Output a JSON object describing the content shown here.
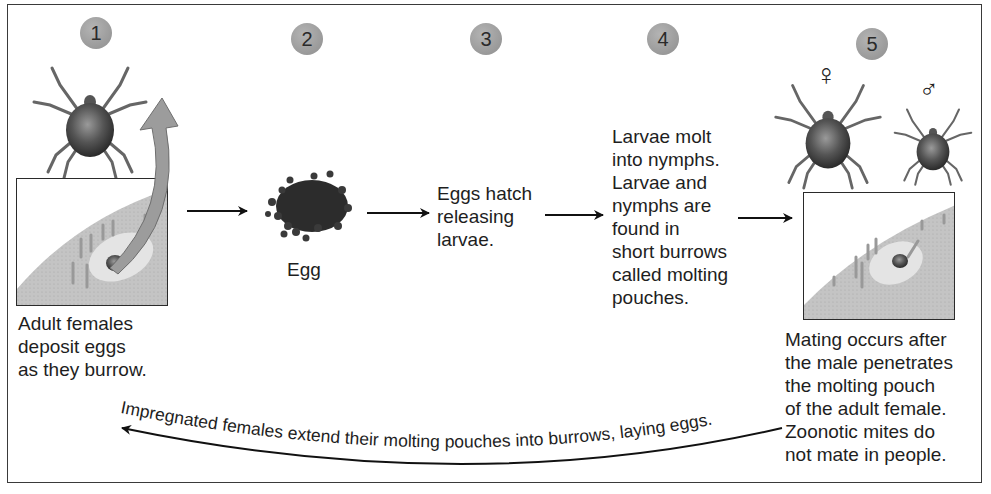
{
  "diagram": {
    "colors": {
      "frame": "#3a3a3a",
      "step_circle": "#a0a0a0",
      "skin": "#c8c8c8",
      "skin_light": "#e6e6e6",
      "mite_body": "#4a4a4a",
      "curved_arrow": "#9a9a9a"
    },
    "steps": [
      {
        "number": "1",
        "caption": "Adult females\ndeposit eggs\nas they burrow.",
        "illustration": "adult-female-mite-and-burrow-panel"
      },
      {
        "number": "2",
        "caption": "Egg",
        "illustration": "egg-cluster"
      },
      {
        "number": "3",
        "caption": "Eggs hatch\nreleasing\nlarvae."
      },
      {
        "number": "4",
        "caption": "Larvae molt\ninto nymphs.\nLarvae and\nnymphs are\nfound in\nshort burrows\ncalled molting\npouches."
      },
      {
        "number": "5",
        "caption": "Mating occurs after\nthe male penetrates\nthe molting pouch\nof the adult female.\nZoonotic mites do\nnot mate in people.",
        "symbols": {
          "female": "♀",
          "male": "♂"
        },
        "illustration": "female-and-male-mites-and-molting-pouch-panel"
      }
    ],
    "return_arrow_label": "Impregnated females extend their molting pouches into burrows, laying eggs."
  }
}
